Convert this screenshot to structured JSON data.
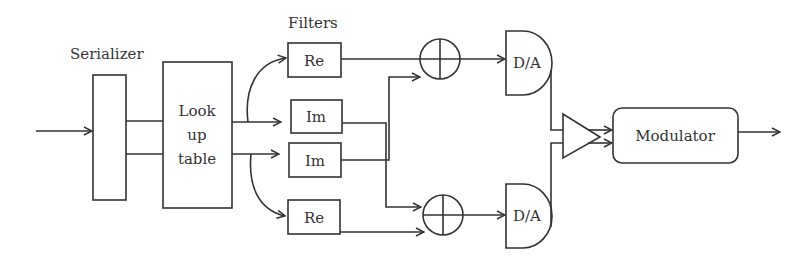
{
  "diagram": {
    "labels": {
      "serializer": "Serializer",
      "filters": "Filters",
      "lut_line1": "Look",
      "lut_line2": "up",
      "lut_line3": "table",
      "re_top": "Re",
      "im_top": "Im",
      "im_bottom": "Im",
      "re_bottom": "Re",
      "da_top": "D/A",
      "da_bottom": "D/A",
      "modulator": "Modulator"
    },
    "nodes": [
      {
        "id": "serializer",
        "type": "rect"
      },
      {
        "id": "lookup-table",
        "type": "rect"
      },
      {
        "id": "filter-re-top",
        "type": "rect"
      },
      {
        "id": "filter-im-top",
        "type": "rect"
      },
      {
        "id": "filter-im-bottom",
        "type": "rect"
      },
      {
        "id": "filter-re-bottom",
        "type": "rect"
      },
      {
        "id": "adder-top",
        "type": "summing-junction"
      },
      {
        "id": "adder-bottom",
        "type": "summing-junction"
      },
      {
        "id": "da-top",
        "type": "dac"
      },
      {
        "id": "da-bottom",
        "type": "dac"
      },
      {
        "id": "amplifier",
        "type": "triangle"
      },
      {
        "id": "modulator",
        "type": "rounded-rect"
      }
    ],
    "edges": [
      [
        "input",
        "serializer"
      ],
      [
        "serializer",
        "lookup-table"
      ],
      [
        "serializer",
        "lookup-table"
      ],
      [
        "lookup-table",
        "filter-re-top"
      ],
      [
        "lookup-table",
        "filter-im-top"
      ],
      [
        "lookup-table",
        "filter-im-bottom"
      ],
      [
        "lookup-table",
        "filter-re-bottom"
      ],
      [
        "filter-re-top",
        "adder-top"
      ],
      [
        "filter-im-bottom",
        "adder-top"
      ],
      [
        "filter-im-top",
        "adder-bottom"
      ],
      [
        "filter-re-bottom",
        "adder-bottom"
      ],
      [
        "adder-top",
        "da-top"
      ],
      [
        "adder-bottom",
        "da-bottom"
      ],
      [
        "da-top",
        "amplifier"
      ],
      [
        "da-bottom",
        "amplifier"
      ],
      [
        "amplifier",
        "modulator"
      ],
      [
        "modulator",
        "output"
      ]
    ]
  }
}
